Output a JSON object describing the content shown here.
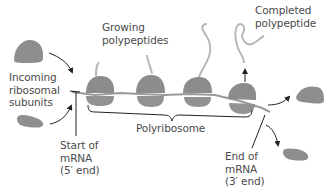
{
  "labels": {
    "growing_polypeptides": "Growing\npolypeptides",
    "completed_polypeptide": "Completed\npolypeptide",
    "incoming_subunits": "Incoming\nribosomal\nsubunits",
    "start_of_mrna": "Start of\nmRNA\n(5′ end)",
    "polyribosome": "Polyribosome",
    "end_of_mrna": "End of\nmRNA\n(3′ end)"
  },
  "colors": {
    "ribosome": "#8c8c8c",
    "ribosome_light": "#a3a3a3",
    "mrna": "#9a9a9a",
    "polypeptide": "#b5b5b5",
    "text": "#4a4a4a",
    "arrow": "#222222"
  },
  "ribosomes_on_mrna": 4
}
